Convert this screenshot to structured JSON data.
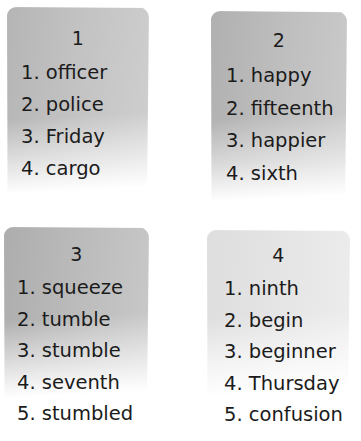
{
  "page": {
    "layout": "2x2-grid",
    "background_color": "#ffffff",
    "text_color": "#1b1b1b"
  },
  "cards": [
    {
      "number": "1",
      "paper_color": "#bdbdbd",
      "items": [
        {
          "index": "1.",
          "word": "officer"
        },
        {
          "index": "2.",
          "word": "police"
        },
        {
          "index": "3.",
          "word": "Friday"
        },
        {
          "index": "4.",
          "word": "cargo"
        }
      ]
    },
    {
      "number": "2",
      "paper_color": "#b8b8b8",
      "items": [
        {
          "index": "1.",
          "word": "happy"
        },
        {
          "index": "2.",
          "word": "fifteenth"
        },
        {
          "index": "3.",
          "word": "happier"
        },
        {
          "index": "4.",
          "word": "sixth"
        }
      ]
    },
    {
      "number": "3",
      "paper_color": "#b3b3b3",
      "items": [
        {
          "index": "1.",
          "word": "squeeze"
        },
        {
          "index": "2.",
          "word": "tumble"
        },
        {
          "index": "3.",
          "word": "stumble"
        },
        {
          "index": "4.",
          "word": "seventh"
        },
        {
          "index": "5.",
          "word": "stumbled"
        }
      ]
    },
    {
      "number": "4",
      "paper_color": "#e3e3e3",
      "items": [
        {
          "index": "1.",
          "word": "ninth"
        },
        {
          "index": "2.",
          "word": "begin"
        },
        {
          "index": "3.",
          "word": "beginner"
        },
        {
          "index": "4.",
          "word": "Thursday"
        },
        {
          "index": "5.",
          "word": "confusion"
        }
      ]
    }
  ]
}
